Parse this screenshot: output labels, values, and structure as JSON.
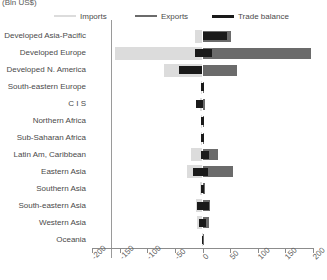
{
  "units_label": "(Bln US$)",
  "legend": {
    "items": [
      {
        "label": "Imports",
        "color": "#dcdcdc",
        "icon": "line-swatch-icon"
      },
      {
        "label": "Exports",
        "color": "#6b6b6b",
        "icon": "line-swatch-icon"
      },
      {
        "label": "Trade balance",
        "color": "#1a1a1a",
        "icon": "line-swatch-icon"
      }
    ]
  },
  "chart_data": {
    "type": "bar",
    "orientation": "horizontal",
    "title": "",
    "subtitle": "",
    "xlabel": "(Bln US$)",
    "ylabel": "",
    "xlim": [
      -200,
      200
    ],
    "xticks": [
      -200,
      -150,
      -100,
      -50,
      0,
      50,
      100,
      150,
      200
    ],
    "xticklabels": [
      "-200",
      "-150",
      "-100",
      "-50",
      "0",
      "50",
      "100",
      "150",
      "200"
    ],
    "grid": false,
    "legend_position": "top",
    "categories": [
      "Developed Asia-Pacific",
      "Developed Europe",
      "Developed N. America",
      "South-eastern Europe",
      "C I S",
      "Northern Africa",
      "Sub-Saharan Africa",
      "Latin Am, Caribbean",
      "Eastern Asia",
      "Southern Asia",
      "South-eastern Asia",
      "Western Asia",
      "Oceania"
    ],
    "series": [
      {
        "name": "Imports",
        "color": "#dcdcdc",
        "values": [
          -14,
          -158,
          -70,
          -2,
          -5,
          -2,
          -3,
          -20,
          -28,
          -5,
          -11,
          -10,
          -1
        ]
      },
      {
        "name": "Exports",
        "color": "#6b6b6b",
        "values": [
          52,
          196,
          62,
          3,
          4,
          2,
          3,
          28,
          56,
          5,
          13,
          11,
          1
        ]
      },
      {
        "name": "Trade balance",
        "color": "#1a1a1a",
        "values": [
          44,
          18,
          -42,
          1,
          -12,
          1,
          1,
          12,
          10,
          2,
          4,
          3,
          0
        ]
      }
    ],
    "trade_balance_spans": [
      {
        "category": "Developed Asia-Pacific",
        "start": 0,
        "end": 44
      },
      {
        "category": "Developed Europe",
        "start": -14,
        "end": 18
      },
      {
        "category": "Developed N. America",
        "start": -42,
        "end": 0
      },
      {
        "category": "South-eastern Europe",
        "start": -2,
        "end": 2
      },
      {
        "category": "C I S",
        "start": -12,
        "end": 1
      },
      {
        "category": "Northern Africa",
        "start": -2,
        "end": 2
      },
      {
        "category": "Sub-Saharan Africa",
        "start": -2,
        "end": 2
      },
      {
        "category": "Latin Am, Caribbean",
        "start": -2,
        "end": 12
      },
      {
        "category": "Eastern Asia",
        "start": -18,
        "end": 10
      },
      {
        "category": "Southern Asia",
        "start": -3,
        "end": 3
      },
      {
        "category": "South-eastern Asia",
        "start": -10,
        "end": 12
      },
      {
        "category": "Western Asia",
        "start": -6,
        "end": 6
      },
      {
        "category": "Oceania",
        "start": -1,
        "end": 1
      }
    ]
  }
}
